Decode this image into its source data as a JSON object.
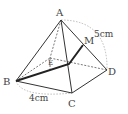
{
  "diagram": {
    "type": "square-pyramid",
    "vertices": {
      "A": {
        "label": "A",
        "x": 61,
        "y": 20
      },
      "B": {
        "label": "B",
        "x": 16,
        "y": 81
      },
      "C": {
        "label": "C",
        "x": 72,
        "y": 93
      },
      "D": {
        "label": "D",
        "x": 107,
        "y": 70
      },
      "E": {
        "label": "E",
        "x": 50,
        "y": 58
      },
      "M": {
        "label": "M",
        "x": 83,
        "y": 45
      }
    },
    "measurements": {
      "edge_AD": "5cm",
      "edge_BC": "4cm"
    },
    "colors": {
      "line": "#333333",
      "dashed": "#555555",
      "dotted": "#aaaaaa"
    }
  }
}
